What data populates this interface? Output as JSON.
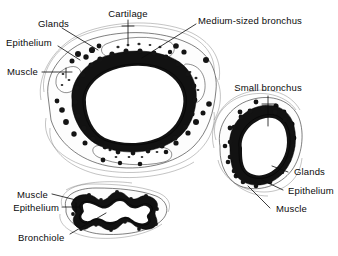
{
  "figure": {
    "background_color": "#ffffff",
    "ink_color": "#0b0b0b",
    "style": "black-and-white histological line drawing"
  },
  "specimens": [
    {
      "id": "medium-sized-bronchus",
      "name": "Medium-sized bronchus",
      "title_label": "Medium-sized bronchus",
      "shape": "large oval ring",
      "labels": [
        "Glands",
        "Cartilage",
        "Epithelium",
        "Muscle",
        "Medium-sized bronchus"
      ]
    },
    {
      "id": "small-bronchus",
      "name": "Small bronchus",
      "title_label": "Small bronchus",
      "shape": "smaller oblique oval ring",
      "labels": [
        "Small bronchus",
        "Glands",
        "Epithelium",
        "Muscle"
      ]
    },
    {
      "id": "bronchiole",
      "name": "Bronchiole",
      "title_label": "Bronchiole",
      "shape": "irregular stellate lumen",
      "labels": [
        "Muscle",
        "Epithelium",
        "Bronchiole"
      ]
    }
  ],
  "annotations": {
    "medium": {
      "glands": "Glands",
      "cartilage": "Cartilage",
      "epithelium": "Epithelium",
      "muscle": "Muscle",
      "title": "Medium-sized bronchus"
    },
    "small": {
      "title": "Small bronchus",
      "glands": "Glands",
      "epithelium": "Epithelium",
      "muscle": "Muscle"
    },
    "bronchiole": {
      "muscle": "Muscle",
      "epithelium": "Epithelium",
      "title": "Bronchiole"
    }
  }
}
